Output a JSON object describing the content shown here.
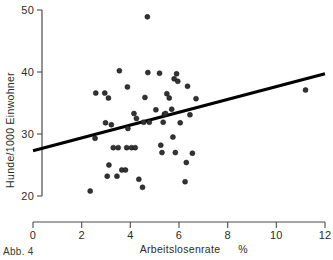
{
  "figure": {
    "caption": "Abb. 4"
  },
  "chart_data": {
    "type": "scatter",
    "title": "",
    "xlabel": "Arbeitslosenrate",
    "xunit": "%",
    "ylabel": "Hunde/1000 Einwohner",
    "xlim": [
      0,
      12
    ],
    "ylim": [
      20,
      50
    ],
    "xticks": [
      0,
      2,
      4,
      6,
      8,
      10,
      12
    ],
    "xticklabels": [
      "0",
      "2",
      "4",
      "6",
      "8",
      "10",
      "12"
    ],
    "yticks": [
      20,
      30,
      40,
      50
    ],
    "yticklabels": [
      "20",
      "30",
      "40",
      "50"
    ],
    "grid": false,
    "legend": false,
    "marker": "filled-circle",
    "points": [
      [
        2.35,
        20.8
      ],
      [
        2.55,
        29.3
      ],
      [
        2.58,
        36.6
      ],
      [
        2.95,
        36.6
      ],
      [
        2.98,
        31.8
      ],
      [
        3.05,
        23.2
      ],
      [
        3.1,
        35.8
      ],
      [
        3.12,
        25.0
      ],
      [
        3.22,
        31.5
      ],
      [
        3.3,
        27.8
      ],
      [
        3.45,
        23.2
      ],
      [
        3.5,
        27.8
      ],
      [
        3.55,
        40.2
      ],
      [
        3.65,
        24.2
      ],
      [
        3.8,
        24.2
      ],
      [
        3.85,
        27.8
      ],
      [
        3.88,
        37.6
      ],
      [
        3.9,
        30.9
      ],
      [
        4.05,
        27.8
      ],
      [
        4.15,
        33.3
      ],
      [
        4.2,
        27.8
      ],
      [
        4.25,
        32.5
      ],
      [
        4.35,
        22.7
      ],
      [
        4.5,
        21.4
      ],
      [
        4.55,
        31.9
      ],
      [
        4.6,
        35.9
      ],
      [
        4.7,
        48.9
      ],
      [
        4.72,
        39.9
      ],
      [
        4.78,
        31.9
      ],
      [
        5.05,
        33.9
      ],
      [
        5.2,
        39.8
      ],
      [
        5.25,
        28.2
      ],
      [
        5.3,
        27.0
      ],
      [
        5.35,
        31.9
      ],
      [
        5.4,
        33.2
      ],
      [
        5.45,
        33.3
      ],
      [
        5.5,
        36.5
      ],
      [
        5.6,
        35.8
      ],
      [
        5.7,
        34.0
      ],
      [
        5.75,
        29.5
      ],
      [
        5.8,
        38.9
      ],
      [
        5.85,
        27.0
      ],
      [
        5.9,
        39.7
      ],
      [
        5.95,
        38.5
      ],
      [
        6.05,
        31.8
      ],
      [
        6.25,
        22.3
      ],
      [
        6.3,
        25.4
      ],
      [
        6.35,
        37.7
      ],
      [
        6.45,
        33.1
      ],
      [
        6.55,
        26.9
      ],
      [
        6.7,
        35.7
      ],
      [
        11.2,
        37.1
      ]
    ],
    "trendline": {
      "label": "regression-line",
      "x": [
        0,
        12
      ],
      "y": [
        27.3,
        39.7
      ]
    }
  }
}
